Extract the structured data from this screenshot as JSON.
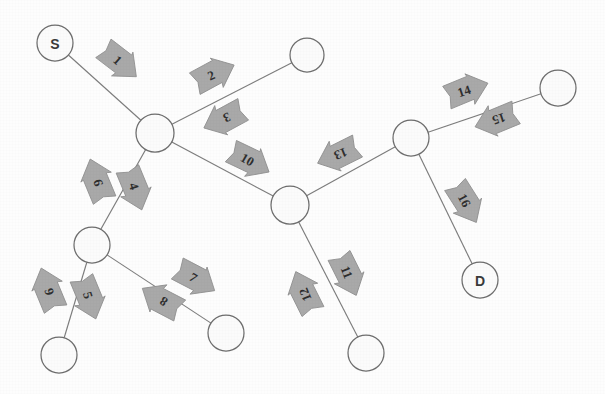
{
  "diagram": {
    "background_color": "#fdfdfd",
    "node_fill": "#fbfbfb",
    "node_stroke": "#6e6e6e",
    "edge_color": "#7d7d7d",
    "arrow_fill": "#a9a9a9",
    "arrow_stroke": "#8f8f8f",
    "label_color": "#2e2e2e"
  },
  "nodes": [
    {
      "id": "n1",
      "label": "S",
      "x": 55,
      "y": 43,
      "r": 18,
      "has_label": true
    },
    {
      "id": "n2",
      "label": "",
      "x": 155,
      "y": 133,
      "r": 19,
      "has_label": false
    },
    {
      "id": "n3",
      "label": "",
      "x": 307,
      "y": 55,
      "r": 17,
      "has_label": false
    },
    {
      "id": "n4",
      "label": "",
      "x": 290,
      "y": 205,
      "r": 19,
      "has_label": false
    },
    {
      "id": "n5",
      "label": "",
      "x": 411,
      "y": 138,
      "r": 18,
      "has_label": false
    },
    {
      "id": "n6",
      "label": "",
      "x": 558,
      "y": 88,
      "r": 18,
      "has_label": false
    },
    {
      "id": "n7",
      "label": "D",
      "x": 480,
      "y": 280,
      "r": 18,
      "has_label": true
    },
    {
      "id": "n8",
      "label": "",
      "x": 92,
      "y": 245,
      "r": 18,
      "has_label": false
    },
    {
      "id": "n9",
      "label": "",
      "x": 59,
      "y": 355,
      "r": 18,
      "has_label": false
    },
    {
      "id": "n10",
      "label": "",
      "x": 226,
      "y": 333,
      "r": 18,
      "has_label": false
    },
    {
      "id": "n11",
      "label": "",
      "x": 366,
      "y": 353,
      "r": 18,
      "has_label": false
    }
  ],
  "edges": [
    {
      "id": "e1",
      "from": "n1",
      "to": "n2"
    },
    {
      "id": "e2",
      "from": "n2",
      "to": "n3"
    },
    {
      "id": "e3",
      "from": "n2",
      "to": "n4"
    },
    {
      "id": "e4",
      "from": "n2",
      "to": "n8"
    },
    {
      "id": "e5",
      "from": "n8",
      "to": "n9"
    },
    {
      "id": "e6",
      "from": "n8",
      "to": "n10"
    },
    {
      "id": "e7",
      "from": "n4",
      "to": "n5"
    },
    {
      "id": "e8",
      "from": "n4",
      "to": "n11"
    },
    {
      "id": "e9",
      "from": "n5",
      "to": "n6"
    },
    {
      "id": "e10",
      "from": "n5",
      "to": "n7"
    }
  ],
  "arrows": [
    {
      "label": "1",
      "x": 120,
      "y": 62,
      "angle": 42,
      "flip": false
    },
    {
      "label": "2",
      "x": 214,
      "y": 74,
      "angle": -24,
      "flip": false
    },
    {
      "label": "3",
      "x": 224,
      "y": 119,
      "angle": -24,
      "flip": true
    },
    {
      "label": "4",
      "x": 135,
      "y": 189,
      "angle": 72,
      "flip": false
    },
    {
      "label": "5",
      "x": 89,
      "y": 298,
      "angle": 72,
      "flip": false
    },
    {
      "label": "6",
      "x": 48,
      "y": 289,
      "angle": 72,
      "flip": true
    },
    {
      "label": "7",
      "x": 196,
      "y": 279,
      "angle": 32,
      "flip": false
    },
    {
      "label": "8",
      "x": 161,
      "y": 300,
      "angle": 32,
      "flip": true
    },
    {
      "label": "9",
      "x": 97,
      "y": 180,
      "angle": 72,
      "flip": true
    },
    {
      "label": "10",
      "x": 250,
      "y": 161,
      "angle": 30,
      "flip": false
    },
    {
      "label": "11",
      "x": 348,
      "y": 275,
      "angle": 68,
      "flip": false
    },
    {
      "label": "12",
      "x": 304,
      "y": 292,
      "angle": 68,
      "flip": true
    },
    {
      "label": "13",
      "x": 338,
      "y": 155,
      "angle": -22,
      "flip": true
    },
    {
      "label": "14",
      "x": 467,
      "y": 90,
      "angle": -18,
      "flip": false
    },
    {
      "label": "15",
      "x": 496,
      "y": 120,
      "angle": -18,
      "flip": true
    },
    {
      "label": "16",
      "x": 466,
      "y": 203,
      "angle": 62,
      "flip": false
    }
  ],
  "legend": {
    "source_node": "S",
    "destination_node": "D",
    "arrow_count": 16,
    "node_count": 11,
    "edge_count": 10
  }
}
